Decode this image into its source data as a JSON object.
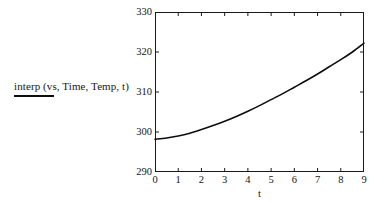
{
  "chart_data": {
    "type": "line",
    "title": "",
    "xlabel": "t",
    "ylabel": "",
    "xlim": [
      0,
      9
    ],
    "ylim": [
      290,
      330
    ],
    "grid": false,
    "legend_position": "left",
    "series": [
      {
        "name": "interp (vs, Time, Temp, t)",
        "color": "#0d0d0d",
        "x": [
          0,
          0.5,
          1,
          1.5,
          2,
          2.5,
          3,
          3.5,
          4,
          4.5,
          5,
          5.5,
          6,
          6.5,
          7,
          7.5,
          8,
          8.5,
          9
        ],
        "y": [
          298.2,
          298.5,
          299.0,
          299.7,
          300.6,
          301.6,
          302.7,
          303.9,
          305.2,
          306.6,
          308.1,
          309.6,
          311.2,
          312.8,
          314.5,
          316.3,
          318.1,
          320.0,
          322.2
        ]
      }
    ],
    "x_ticks": [
      {
        "value": 0,
        "label": "0"
      },
      {
        "value": 1,
        "label": "1"
      },
      {
        "value": 2,
        "label": "2"
      },
      {
        "value": 3,
        "label": "3"
      },
      {
        "value": 4,
        "label": "4"
      },
      {
        "value": 5,
        "label": "5"
      },
      {
        "value": 6,
        "label": "6"
      },
      {
        "value": 7,
        "label": "7"
      },
      {
        "value": 8,
        "label": "8"
      },
      {
        "value": 9,
        "label": "9"
      }
    ],
    "y_ticks": [
      {
        "value": 290,
        "label": "290"
      },
      {
        "value": 300,
        "label": "300"
      },
      {
        "value": 310,
        "label": "310"
      },
      {
        "value": 320,
        "label": "320"
      },
      {
        "value": 330,
        "label": "330"
      }
    ]
  },
  "legend": {
    "label": "interp (vs, Time, Temp, t)",
    "swatch_color": "#0d0d0d"
  },
  "axes": {
    "x_title": "t",
    "frame_color": "#1a1a1a"
  }
}
